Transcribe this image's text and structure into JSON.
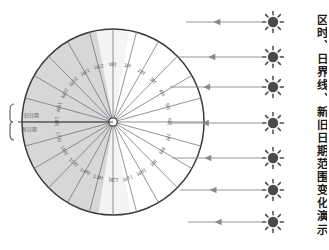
{
  "page": {
    "title_vertical": "区时、日界线、新旧日期范围变化演示学具",
    "background_color": "#ffffff"
  },
  "colors": {
    "outline": "#3a3a3a",
    "radial_line": "#6e6e78",
    "night_shading": "#d7d7d7",
    "twilight_shading": "#eaeaea",
    "day_side": "#ffffff",
    "sun": "#4a4a4a",
    "ray": "#8a8a8a",
    "label_text": "#5a5a5a"
  },
  "globe": {
    "name": "timezone-dial",
    "center_x": 113,
    "center_y": 122,
    "radius_x": 91,
    "radius_y": 93,
    "sector_count": 24,
    "hub_label": "",
    "day_night_terminator_deg": [
      90,
      270
    ],
    "timezone_labels": [
      "0时",
      "1时",
      "2时",
      "3时",
      "4时",
      "5时",
      "6时",
      "7时",
      "8时",
      "9时",
      "10时",
      "11时",
      "12时",
      "13时",
      "14时",
      "15时",
      "16时",
      "17时",
      "18时",
      "19时",
      "20时",
      "21时",
      "22时",
      "23时"
    ]
  },
  "left_bracket": {
    "name": "date-line-bracket",
    "labels": [
      {
        "text": "旧日期",
        "x": 24,
        "y": 117
      },
      {
        "text": "新日期",
        "x": 22,
        "y": 131
      }
    ]
  },
  "sun_rays": {
    "count": 7,
    "direction": "left",
    "items": [
      {
        "sun_y": 22,
        "ray_start_x": 186,
        "ray_end_x": 262
      },
      {
        "sun_y": 57,
        "ray_start_x": 178,
        "ray_end_x": 262
      },
      {
        "sun_y": 87,
        "ray_start_x": 170,
        "ray_end_x": 262
      },
      {
        "sun_y": 123,
        "ray_start_x": 168,
        "ray_end_x": 262
      },
      {
        "sun_y": 158,
        "ray_start_x": 172,
        "ray_end_x": 262
      },
      {
        "sun_y": 190,
        "ray_start_x": 180,
        "ray_end_x": 262
      },
      {
        "sun_y": 222,
        "ray_start_x": 188,
        "ray_end_x": 262
      }
    ]
  }
}
